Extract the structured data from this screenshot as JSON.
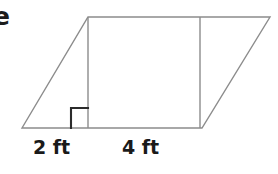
{
  "figure": {
    "kind": "geometry-diagram",
    "shape": "parallelogram-with-inscribed-rectangle",
    "stroke_color": "#8c8c8c",
    "right_angle_color": "#2b2b2b",
    "background_color": "#ffffff",
    "cropped_text": {
      "letter": "e"
    },
    "labels": {
      "left_base": "2 ft",
      "right_base": "4 ft"
    },
    "markers": {
      "right_angle": "right-angle-square"
    },
    "geometry": {
      "parallelogram_points": "22,128 88,17 270,17 202,128",
      "left_vertical": {
        "x1": 88,
        "y1": 17,
        "x2": 88,
        "y2": 128
      },
      "right_vertical": {
        "x1": 200,
        "y1": 17,
        "x2": 200,
        "y2": 128
      },
      "right_angle_path": "M 71,128 L 71,108 L 88,108"
    }
  }
}
